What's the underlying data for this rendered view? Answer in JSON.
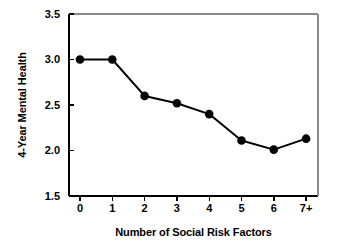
{
  "chart_data": {
    "type": "line",
    "title": "",
    "xlabel": "Number of Social Risk Factors",
    "ylabel": "4-Year Mental Health",
    "categories": [
      "0",
      "1",
      "2",
      "3",
      "4",
      "5",
      "6",
      "7+"
    ],
    "values": [
      3.0,
      3.0,
      2.6,
      2.52,
      2.4,
      2.11,
      2.01,
      2.13
    ],
    "ylim": [
      1.5,
      3.5
    ],
    "yticks": [
      "1.5",
      "2.0",
      "2.5",
      "3.0",
      "3.5"
    ],
    "ytick_values": [
      1.5,
      2.0,
      2.5,
      3.0,
      3.5
    ],
    "xticks": [
      "0",
      "1",
      "2",
      "3",
      "4",
      "5",
      "6",
      "7+"
    ],
    "grid": false,
    "legend": "none",
    "series": [
      {
        "name": "4-Year Mental Health",
        "values": [
          3.0,
          3.0,
          2.6,
          2.52,
          2.4,
          2.11,
          2.01,
          2.13
        ],
        "line_color": "#000000",
        "marker": "filled-circle",
        "marker_color": "#000000"
      }
    ],
    "colors": {
      "background": "#ffffff",
      "axis": "#000000",
      "line": "#000000",
      "marker": "#000000",
      "text": "#000000"
    }
  }
}
